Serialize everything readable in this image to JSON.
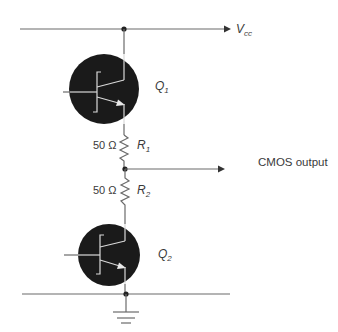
{
  "diagram": {
    "type": "totem-pole BJT output stage",
    "supply": {
      "label": "V",
      "subscript": "cc"
    },
    "transistors": [
      {
        "id": "Q1",
        "label": "Q",
        "subscript": "1",
        "position": "top"
      },
      {
        "id": "Q2",
        "label": "Q",
        "subscript": "2",
        "position": "bottom"
      }
    ],
    "resistors": [
      {
        "id": "R1",
        "label": "R",
        "subscript": "1",
        "value": "50 Ω"
      },
      {
        "id": "R2",
        "label": "R",
        "subscript": "2",
        "value": "50 Ω"
      }
    ],
    "output": {
      "label": "CMOS output"
    },
    "ground": {
      "symbol": "ground"
    },
    "colors": {
      "wire": "#6b6b6b",
      "transistor_body": "#1a1a1a",
      "transistor_inner": "#d9d9d9",
      "text": "#3a3a3a"
    }
  }
}
